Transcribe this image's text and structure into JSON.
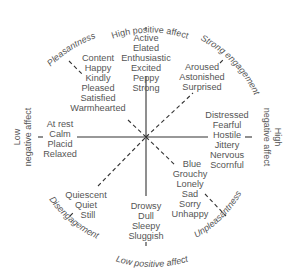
{
  "diagram": {
    "colors": {
      "line": "#333333",
      "text": "#555555",
      "background": "#ffffff"
    },
    "axes": {
      "top": "High positive affect",
      "bottom": "Low positive affect",
      "upper_right": "Strong engagement",
      "lower_left": "Disengagement",
      "upper_left": "Pleasantness",
      "lower_right": "Unpleasantness",
      "right": "High negative affect",
      "right_line1": "High",
      "right_line2": "negative affect",
      "left_line1": "Low",
      "left_line2": "negative affect"
    },
    "clusters": {
      "high_positive": [
        "Active",
        "Elated",
        "Enthusiastic",
        "Excited",
        "Peppy",
        "Strong"
      ],
      "strong_engagement": [
        "Aroused",
        "Astonished",
        "Surprised"
      ],
      "high_negative": [
        "Distressed",
        "Fearful",
        "Hostile",
        "Jittery",
        "Nervous",
        "Scornful"
      ],
      "unpleasantness": [
        "Blue",
        "Grouchy",
        "Lonely",
        "Sad",
        "Sorry",
        "Unhappy"
      ],
      "low_positive": [
        "Drowsy",
        "Dull",
        "Sleepy",
        "Sluggish"
      ],
      "disengagement": [
        "Quiescent",
        "Quiet",
        "Still"
      ],
      "low_negative": [
        "At rest",
        "Calm",
        "Placid",
        "Relaxed"
      ],
      "pleasantness": [
        "Content",
        "Happy",
        "Kindly",
        "Pleased",
        "Satisfied",
        "Warmhearted"
      ]
    }
  }
}
